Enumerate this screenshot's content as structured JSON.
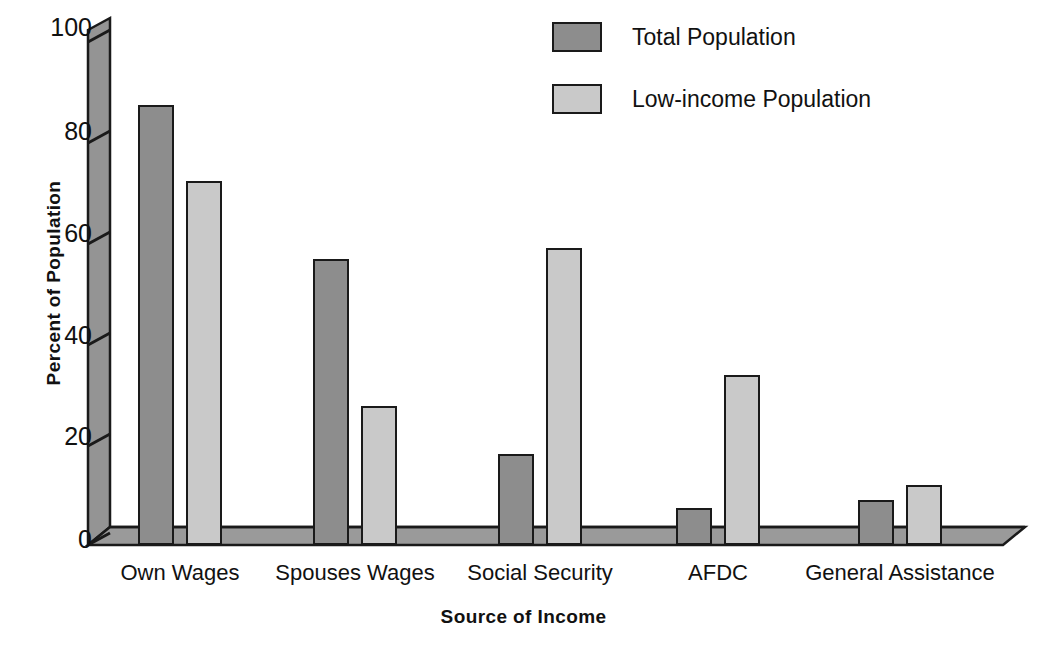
{
  "chart_data": {
    "type": "bar",
    "title": "",
    "xlabel": "Source of Income",
    "ylabel": "Percent of Population",
    "categories": [
      "Own Wages",
      "Spouses Wages",
      "Social Security",
      "AFDC",
      "General Assistance"
    ],
    "series": [
      {
        "name": "Total Population",
        "color": "#8d8d8d",
        "values": [
          86.5,
          56.1,
          17.8,
          7.2,
          8.9
        ]
      },
      {
        "name": "Low-income Population",
        "color": "#c9c9c9",
        "values": [
          71.6,
          27.4,
          58.4,
          33.5,
          11.8
        ]
      }
    ],
    "ylim": [
      0,
      100
    ],
    "yticks": [
      0,
      20,
      40,
      60,
      80,
      100
    ],
    "ytick_labels": [
      "0",
      "20",
      "40",
      "60",
      "80",
      "100"
    ],
    "grid": false,
    "legend_position": "top-right",
    "style": "3d-shaded-axis"
  },
  "legend": {
    "items": [
      {
        "label": "Total Population",
        "color": "#8d8d8d"
      },
      {
        "label": "Low-income Population",
        "color": "#c9c9c9"
      }
    ]
  },
  "axes": {
    "y_title": "Percent of Population",
    "x_title": "Source of Income",
    "y_tick_0": "0",
    "y_tick_20": "20",
    "y_tick_40": "40",
    "y_tick_60": "60",
    "y_tick_80": "80",
    "y_tick_100": "100"
  },
  "colors": {
    "bar_dark": "#8d8d8d",
    "bar_light": "#c9c9c9",
    "axis_wall": "#949494",
    "axis_floor": "#9a9a9a",
    "outline": "#1a1a1a",
    "background": "#ffffff"
  }
}
